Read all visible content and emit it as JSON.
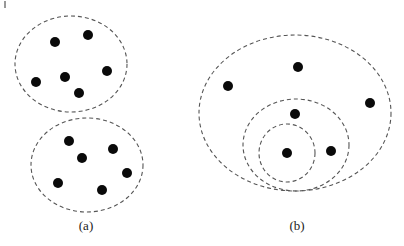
{
  "figure": {
    "width": 404,
    "height": 246,
    "colors": {
      "background": "#ffffff",
      "point": "#0a0a0a",
      "outline": "#555555",
      "label": "#222222"
    },
    "point_radius": 5,
    "panels": [
      {
        "id": "a",
        "label": "(a)",
        "label_pos": [
          86,
          230
        ],
        "clusters": [
          {
            "name": "top-cluster",
            "ellipse": {
              "cx": 71,
              "cy": 64,
              "rx": 56,
              "ry": 48
            },
            "points": [
              [
                55,
                42
              ],
              [
                88,
                35
              ],
              [
                36,
                82
              ],
              [
                65,
                77
              ],
              [
                107,
                71
              ],
              [
                79,
                93
              ]
            ]
          },
          {
            "name": "bottom-cluster",
            "ellipse": {
              "cx": 87,
              "cy": 165,
              "rx": 56,
              "ry": 47
            },
            "points": [
              [
                69,
                141
              ],
              [
                113,
                149
              ],
              [
                82,
                158
              ],
              [
                127,
                173
              ],
              [
                58,
                183
              ],
              [
                102,
                190
              ]
            ]
          }
        ]
      },
      {
        "id": "b",
        "label": "(b)",
        "label_pos": [
          297,
          230
        ],
        "nested_outlines": [
          {
            "name": "outer-ellipse",
            "cx": 295,
            "cy": 113,
            "rx": 96,
            "ry": 78
          },
          {
            "name": "middle-ellipse",
            "cx": 296,
            "cy": 145,
            "rx": 53,
            "ry": 46
          },
          {
            "name": "inner-circle",
            "cx": 287,
            "cy": 153,
            "rx": 28,
            "ry": 29
          }
        ],
        "points": [
          [
            228,
            86
          ],
          [
            298,
            67
          ],
          [
            370,
            103
          ],
          [
            295,
            114
          ],
          [
            287,
            153
          ],
          [
            331,
            151
          ]
        ]
      }
    ]
  }
}
